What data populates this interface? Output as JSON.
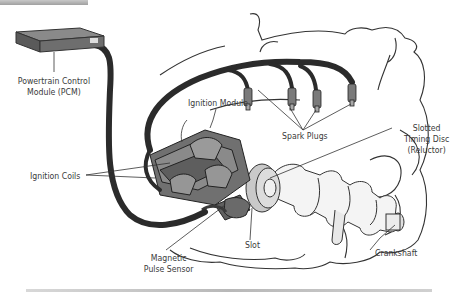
{
  "labels": {
    "pcm_line1": "Powertrain Control",
    "pcm_line2": "Module (PCM)",
    "ignition_module": "Ignition Module",
    "spark_plugs": "Spark Plugs",
    "timing_disc_line1": "Slotted",
    "timing_disc_line2": "Timing Disc",
    "timing_disc_line3": "(Reluctor)",
    "ignition_coils": "Ignition Coils",
    "slot": "Slot",
    "crankshaft": "Crankshaft",
    "sensor_line1": "Magnetic",
    "sensor_line2": "Pulse Sensor"
  },
  "colors": {
    "wire": "#2b2b2b",
    "coil": "#6e6e6e",
    "disc": "#c9c9c9",
    "outline": "#333333",
    "text": "#3a3a3a"
  }
}
